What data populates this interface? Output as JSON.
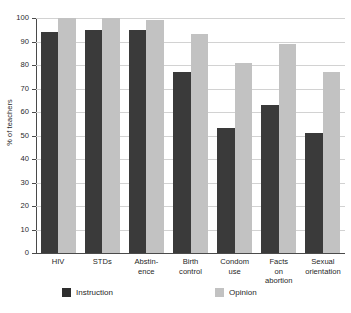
{
  "chart_data": {
    "type": "bar",
    "title": "",
    "subtitle": "",
    "xlabel": "",
    "ylabel": "% of teachers",
    "ylim": [
      0,
      100
    ],
    "ytick_step": 10,
    "yticks": [
      0,
      10,
      20,
      30,
      40,
      50,
      60,
      70,
      80,
      90,
      100
    ],
    "grid": "horizontal",
    "legend_position": "bottom",
    "categories": [
      "HIV",
      "STDs",
      "Abstin-\nence",
      "Birth\ncontrol",
      "Condom\nuse",
      "Facts\non\nabortion",
      "Sexual\norientation"
    ],
    "series": [
      {
        "name": "Instruction",
        "color": "#3a3a3a",
        "values": [
          94,
          95,
          95,
          77,
          53,
          63,
          51
        ]
      },
      {
        "name": "Opinion",
        "color": "#c2c2c2",
        "values": [
          100,
          100,
          99,
          93,
          81,
          89,
          77
        ]
      }
    ]
  },
  "legend": {
    "items": [
      {
        "label": "Instruction",
        "swatch": "instruction"
      },
      {
        "label": "Opinion",
        "swatch": "opinion"
      }
    ]
  },
  "colors": {
    "instruction": "#3a3a3a",
    "opinion": "#c2c2c2",
    "gridline": "#d2d2d2",
    "axis": "#4a4a4a",
    "background": "#ffffff"
  }
}
